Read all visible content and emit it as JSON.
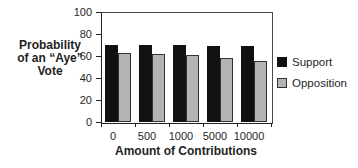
{
  "chart_data": {
    "type": "bar",
    "title": "",
    "categories": [
      "0",
      "500",
      "1000",
      "5000",
      "10000"
    ],
    "series": [
      {
        "name": "Support",
        "color": "#111111",
        "border": "#111111",
        "values": [
          70,
          70,
          70,
          69,
          69
        ]
      },
      {
        "name": "Opposition",
        "color": "#b3b3b3",
        "border": "#333333",
        "values": [
          63,
          62,
          61,
          58,
          55
        ]
      }
    ],
    "xlabel": "Amount of Contributions",
    "ylabel": "Probability of an “Aye” Vote",
    "ylabel_lines": [
      "Probability",
      "of an “Aye”",
      "Vote"
    ],
    "ylim": [
      0,
      100
    ],
    "yticks": [
      0,
      20,
      40,
      60,
      80,
      100
    ],
    "grid": false,
    "legend_position": "right"
  }
}
